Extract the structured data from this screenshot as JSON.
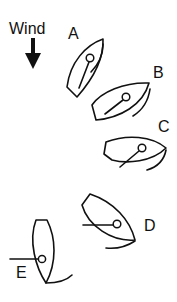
{
  "wind": {
    "label": "Wind",
    "direction": "down",
    "icon": "down-arrow-icon"
  },
  "boats": [
    {
      "id": "A",
      "label": "A"
    },
    {
      "id": "B",
      "label": "B"
    },
    {
      "id": "C",
      "label": "C"
    },
    {
      "id": "D",
      "label": "D"
    },
    {
      "id": "E",
      "label": "E"
    }
  ],
  "colors": {
    "stroke": "#111111",
    "background": "#ffffff"
  }
}
